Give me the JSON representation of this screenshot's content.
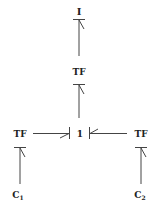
{
  "diagram": {
    "type": "bond-graph",
    "nodes": {
      "inertia": {
        "label": "I"
      },
      "tf_top": {
        "label": "TF"
      },
      "junction": {
        "label": "1"
      },
      "tf_left": {
        "label": "TF"
      },
      "tf_right": {
        "label": "TF"
      },
      "c1": {
        "label": "C",
        "subscript": "1"
      },
      "c2": {
        "label": "C",
        "subscript": "2"
      }
    },
    "bonds": [
      {
        "from": "tf_top",
        "to": "inertia"
      },
      {
        "from": "junction",
        "to": "tf_top"
      },
      {
        "from": "tf_left",
        "to": "junction"
      },
      {
        "from": "tf_right",
        "to": "junction"
      },
      {
        "from": "c1",
        "to": "tf_left"
      },
      {
        "from": "c2",
        "to": "tf_right"
      }
    ],
    "colors": {
      "line": "#444444",
      "text": "#222222",
      "background": "#ffffff"
    }
  }
}
